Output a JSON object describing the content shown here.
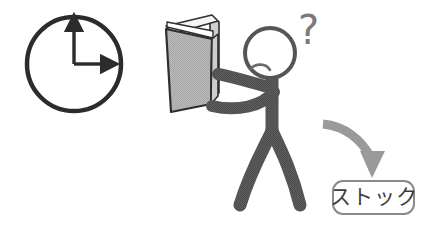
{
  "illustration": {
    "title": "Stick figure reading a book next to a clock with arrow to stock label",
    "background_color": "#ffffff"
  },
  "clock": {
    "name": "clock",
    "hour_hand_position": "12",
    "minute_hand_position": "3",
    "display_time": "3:00",
    "stroke_color": "#2c2c2c",
    "face_color": "#ffffff",
    "center": {
      "cx": 74,
      "cy": 64
    },
    "radius": 47,
    "stroke_width": 4.5,
    "hands": [
      {
        "name": "vertical-hand",
        "direction": "up",
        "length": 40,
        "arrowhead": true
      },
      {
        "name": "horizontal-hand",
        "direction": "right",
        "length": 36,
        "arrowhead": true
      }
    ]
  },
  "book": {
    "name": "open-book",
    "state": "open",
    "cover_color": "#b5b5b5",
    "outline_color": "#2e2e2e",
    "pages_color": "#ffffff",
    "orientation": "held-upright-facing-away"
  },
  "figure": {
    "name": "stick-figure",
    "limb_color": "#585858",
    "head_outline_color": "#555555",
    "head_fill": "#ffffff",
    "expression": "puzzled",
    "mouth": "frown",
    "arms": 2,
    "legs": 2,
    "pose": "holding-book-up"
  },
  "question_mark": {
    "name": "question-mark",
    "glyph": "?",
    "color": "#7a7a7a",
    "font_size": 40
  },
  "arrow": {
    "name": "curved-arrow",
    "color": "#9a9a9a",
    "direction": "down",
    "curve": "sweeping-right-then-down",
    "stroke_width": 9
  },
  "callout": {
    "name": "stock-callout",
    "text": "ストック",
    "romaji_meaning": "stock",
    "border_color": "#8a8a8a",
    "fill_color": "#ffffff",
    "text_color": "#3c3c3c",
    "corner_radius": 10
  }
}
